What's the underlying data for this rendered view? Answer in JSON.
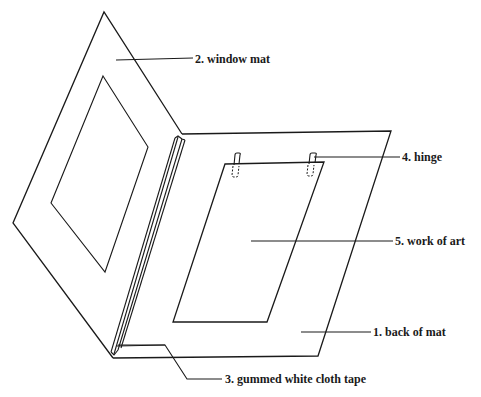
{
  "diagram": {
    "type": "technical-illustration",
    "line_color": "#1a1a1a",
    "background": "#ffffff"
  },
  "labels": [
    {
      "id": "window-mat",
      "number": "2.",
      "text": "window mat",
      "full": "2.  window mat",
      "x": 195,
      "y": 54
    },
    {
      "id": "hinge",
      "number": "4.",
      "text": "hinge",
      "full": "4.  hinge",
      "x": 402,
      "y": 154
    },
    {
      "id": "work-of-art",
      "number": "5.",
      "text": "work of art",
      "full": "5.  work of art",
      "x": 395,
      "y": 235
    },
    {
      "id": "back-of-mat",
      "number": "1.",
      "text": "back of mat",
      "full": "1.  back of mat",
      "x": 373,
      "y": 325
    },
    {
      "id": "cloth-tape",
      "number": "3.",
      "text": "gummed white cloth tape",
      "full": "3.  gummed white cloth tape",
      "x": 225,
      "y": 372
    }
  ],
  "parts": [
    {
      "id": "back-of-mat",
      "shape": "parallelogram",
      "points": [
        [
          182,
          134
        ],
        [
          391,
          131
        ],
        [
          318,
          356
        ],
        [
          113,
          358
        ]
      ]
    },
    {
      "id": "window-mat",
      "shape": "quad",
      "points": [
        [
          104,
          12
        ],
        [
          182,
          134
        ],
        [
          113,
          358
        ],
        [
          13,
          223
        ]
      ]
    },
    {
      "id": "window-opening",
      "shape": "quad",
      "points": [
        [
          103,
          76
        ],
        [
          148,
          147
        ],
        [
          105,
          272
        ],
        [
          51,
          203
        ]
      ]
    },
    {
      "id": "work-of-art",
      "shape": "parallelogram",
      "points": [
        [
          225,
          164
        ],
        [
          324,
          162
        ],
        [
          267,
          322
        ],
        [
          173,
          322
        ]
      ]
    },
    {
      "id": "hinge-left",
      "x": 237,
      "y": 153
    },
    {
      "id": "hinge-right",
      "x": 312,
      "y": 153
    },
    {
      "id": "cloth-tape-spine",
      "from": [
        178,
        136
      ],
      "to": [
        114,
        354
      ]
    }
  ]
}
